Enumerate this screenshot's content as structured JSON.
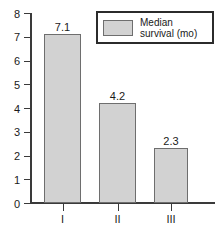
{
  "chart_data": {
    "type": "bar",
    "title": "",
    "xlabel": "",
    "ylabel": "",
    "categories": [
      "I",
      "II",
      "III"
    ],
    "values": [
      7.1,
      4.2,
      2.3
    ],
    "value_labels": [
      "7.1",
      "4.2",
      "2.3"
    ],
    "series": [
      {
        "name": "Median survival (mo)",
        "values": [
          7.1,
          4.2,
          2.3
        ],
        "color": "#d2d2d2"
      }
    ],
    "ylim": [
      0,
      8
    ],
    "yticks": [
      0,
      1,
      2,
      3,
      4,
      5,
      6,
      7,
      8
    ],
    "ytick_labels": [
      "0",
      "1",
      "2",
      "3",
      "4",
      "5",
      "6",
      "7",
      "8"
    ],
    "grid": false,
    "legend_position": "top-right",
    "legend": {
      "entries": [
        {
          "label_line1": "Median",
          "label_line2": "survival (mo)",
          "swatch_color": "#d2d2d2"
        }
      ]
    },
    "colors": {
      "bar_fill": "#d2d2d2",
      "bar_border": "#6e6e6e",
      "axis": "#3a3a3a",
      "text": "#1a1a1a",
      "background": "#ffffff"
    }
  }
}
